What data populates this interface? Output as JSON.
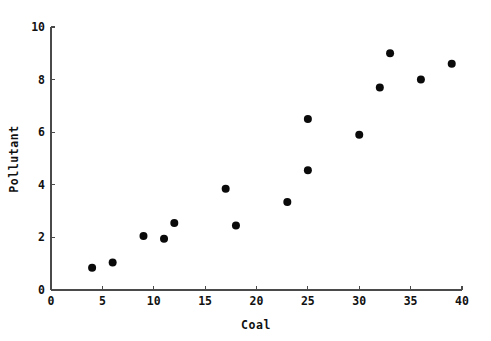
{
  "chart_data": {
    "type": "scatter",
    "title": "",
    "xlabel": "Coal",
    "ylabel": "Pollutant",
    "xlim": [
      0,
      40
    ],
    "ylim": [
      0,
      10
    ],
    "xticks": [
      0,
      5,
      10,
      15,
      20,
      25,
      30,
      35,
      40
    ],
    "yticks": [
      0,
      2,
      4,
      6,
      8,
      10
    ],
    "grid": false,
    "legend": null,
    "marker": "filled-circle",
    "marker_color": "#0a0a0a",
    "marker_size": 8,
    "series": [
      {
        "name": "Pollutant vs Coal",
        "x": [
          4,
          6,
          9,
          11,
          12,
          17,
          18,
          23,
          25,
          25,
          30,
          32,
          33,
          36,
          39
        ],
        "y": [
          0.85,
          1.05,
          2.05,
          1.95,
          2.55,
          3.85,
          2.45,
          3.35,
          4.55,
          6.5,
          5.9,
          7.7,
          9.0,
          8.0,
          8.6
        ],
        "points": [
          {
            "x": 4,
            "y": 0.85
          },
          {
            "x": 6,
            "y": 1.05
          },
          {
            "x": 9,
            "y": 2.05
          },
          {
            "x": 11,
            "y": 1.95
          },
          {
            "x": 12,
            "y": 2.55
          },
          {
            "x": 17,
            "y": 3.85
          },
          {
            "x": 18,
            "y": 2.45
          },
          {
            "x": 23,
            "y": 3.35
          },
          {
            "x": 25,
            "y": 4.55
          },
          {
            "x": 25,
            "y": 6.5
          },
          {
            "x": 30,
            "y": 5.9
          },
          {
            "x": 32,
            "y": 7.7
          },
          {
            "x": 33,
            "y": 9.0
          },
          {
            "x": 36,
            "y": 8.0
          },
          {
            "x": 39,
            "y": 8.6
          }
        ]
      }
    ]
  },
  "axis": {
    "x_tick_labels": [
      "0",
      "5",
      "10",
      "15",
      "20",
      "25",
      "30",
      "35",
      "40"
    ],
    "y_tick_labels": [
      "0",
      "2",
      "4",
      "6",
      "8",
      "10"
    ],
    "x_title": "Coal",
    "y_title": "Pollutant"
  }
}
